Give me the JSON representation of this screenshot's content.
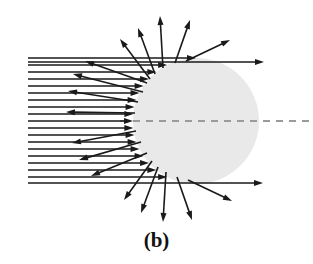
{
  "figure": {
    "label": "(b)",
    "width": 313,
    "height": 264,
    "background_color": "#ffffff"
  },
  "sphere": {
    "name": "scattering-particle",
    "center_x": 196,
    "center_y": 121,
    "radius": 63,
    "fill_color": "#e9e9e9",
    "stroke": "none"
  },
  "axis": {
    "name": "optical-axis",
    "y": 121,
    "x_start": 120,
    "x_end": 313,
    "color": "#9a9a9a",
    "dash": "7,6",
    "width": 2
  },
  "ray_style": {
    "color": "#1a1a1a",
    "width": 1.6,
    "arrow_length": 9,
    "arrow_width": 6
  },
  "incident_beam": {
    "name": "incident-plane-wave",
    "x_start": 28,
    "count": 19,
    "y_top": 58,
    "y_spacing": 7.0,
    "note": "horizontal parallel rays travelling left-to-right, terminating on the left surface of the sphere"
  },
  "transmitted_rays": [
    {
      "name": "forward-ray-top",
      "x1": 28,
      "y1": 62,
      "x2": 264,
      "y2": 62
    },
    {
      "name": "forward-ray-bottom",
      "x1": 28,
      "y1": 183,
      "x2": 263,
      "y2": 183
    }
  ],
  "scattered_rays": [
    {
      "name": "scattered-ray-back-1",
      "x1": 147,
      "y1": 83,
      "x2": 85,
      "y2": 61
    },
    {
      "name": "scattered-ray-back-2",
      "x1": 143,
      "y1": 92,
      "x2": 73,
      "y2": 74
    },
    {
      "name": "scattered-ray-back-3",
      "x1": 138,
      "y1": 102,
      "x2": 68,
      "y2": 91
    },
    {
      "name": "scattered-ray-back-4",
      "x1": 135,
      "y1": 113,
      "x2": 66,
      "y2": 112
    },
    {
      "name": "scattered-ray-back-5",
      "x1": 136,
      "y1": 131,
      "x2": 72,
      "y2": 143
    },
    {
      "name": "scattered-ray-back-6",
      "x1": 141,
      "y1": 142,
      "x2": 79,
      "y2": 160
    },
    {
      "name": "scattered-ray-back-7",
      "x1": 147,
      "y1": 153,
      "x2": 91,
      "y2": 176
    },
    {
      "name": "scattered-ray-up-1",
      "x1": 150,
      "y1": 79,
      "x2": 120,
      "y2": 39
    },
    {
      "name": "scattered-ray-up-2",
      "x1": 155,
      "y1": 74,
      "x2": 138,
      "y2": 28
    },
    {
      "name": "scattered-ray-up-3",
      "x1": 163,
      "y1": 68,
      "x2": 160,
      "y2": 16
    },
    {
      "name": "scattered-ray-up-4",
      "x1": 175,
      "y1": 63,
      "x2": 190,
      "y2": 20
    },
    {
      "name": "scattered-ray-up-5",
      "x1": 186,
      "y1": 61,
      "x2": 230,
      "y2": 40
    },
    {
      "name": "scattered-ray-down-1",
      "x1": 152,
      "y1": 161,
      "x2": 124,
      "y2": 200
    },
    {
      "name": "scattered-ray-down-2",
      "x1": 158,
      "y1": 167,
      "x2": 141,
      "y2": 213
    },
    {
      "name": "scattered-ray-down-3",
      "x1": 166,
      "y1": 172,
      "x2": 163,
      "y2": 222
    },
    {
      "name": "scattered-ray-down-4",
      "x1": 177,
      "y1": 177,
      "x2": 192,
      "y2": 220
    },
    {
      "name": "scattered-ray-down-5",
      "x1": 188,
      "y1": 180,
      "x2": 232,
      "y2": 201
    }
  ]
}
